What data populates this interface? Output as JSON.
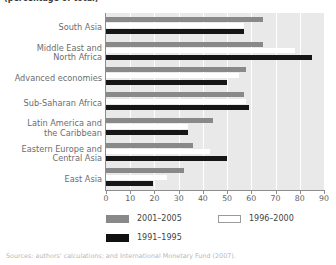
{
  "headline": "(percentage of total)",
  "chart_data": {
    "type": "bar",
    "orientation": "horizontal",
    "title": "",
    "subtitle": "(percentage of total)",
    "xlabel": "",
    "ylabel": "",
    "xlim": [
      0,
      90
    ],
    "xticks": [
      0,
      10,
      20,
      30,
      40,
      50,
      60,
      70,
      80,
      90
    ],
    "grid": true,
    "grid_axis": "x",
    "legend_position": "bottom",
    "categories": [
      "South Asia",
      "Middle East and North Africa",
      "Advanced economies",
      "Sub-Saharan Africa",
      "Latin America and the Caribbean",
      "Eastern Europe and Central Asia",
      "East Asia"
    ],
    "series": [
      {
        "name": "2001–2005",
        "color": "#898989",
        "values": [
          65,
          65,
          58,
          57,
          44,
          36,
          32
        ]
      },
      {
        "name": "1996–2000",
        "color": "#ffffff",
        "values": [
          57,
          78,
          55,
          58,
          34,
          43,
          25
        ]
      },
      {
        "name": "1991–1995",
        "color": "#161616",
        "values": [
          57,
          85,
          50,
          59,
          34,
          50,
          19.5
        ]
      }
    ]
  },
  "axis": {
    "tick_labels": [
      "0",
      "10",
      "20",
      "30",
      "40",
      "50",
      "60",
      "70",
      "80",
      "90"
    ]
  },
  "categories_display": [
    [
      "South Asia"
    ],
    [
      "Middle East and",
      "North Africa"
    ],
    [
      "Advanced economies"
    ],
    [
      "Sub-Saharan Africa"
    ],
    [
      "Latin America and",
      "the Caribbean"
    ],
    [
      "Eastern Europe and",
      "Central Asia"
    ],
    [
      "East Asia"
    ]
  ],
  "legend": [
    {
      "label": "2001–2005",
      "swatch": "g"
    },
    {
      "label": "1996–2000",
      "swatch": "w"
    },
    {
      "label": "1991–1995",
      "swatch": "k"
    }
  ],
  "source_note": "Sources: authors' calculations; and International Monetary Fund (2007)."
}
